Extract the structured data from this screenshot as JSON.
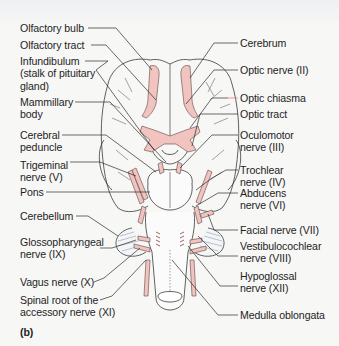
{
  "figure": {
    "panel_label": "(b)",
    "colors": {
      "nerve_pink": "#f2c4c0",
      "outline": "#3a3a3a",
      "leader": "#2b2b2b",
      "highlight_leader": "#e07070",
      "background": "#f7f7f6"
    },
    "left_labels": [
      {
        "id": "olfactory-bulb",
        "text": "Olfactory bulb"
      },
      {
        "id": "olfactory-tract",
        "text": "Olfactory tract"
      },
      {
        "id": "infundibulum",
        "text": "Infundibulum\n(stalk of pituitary\ngland)"
      },
      {
        "id": "mammillary-body",
        "text": "Mammillary\nbody"
      },
      {
        "id": "cerebral-peduncle",
        "text": "Cerebral\npeduncle"
      },
      {
        "id": "trigeminal-nerve",
        "text": "Trigeminal\nnerve (V)"
      },
      {
        "id": "pons",
        "text": "Pons"
      },
      {
        "id": "cerebellum",
        "text": "Cerebellum"
      },
      {
        "id": "glossopharyngeal-nerve",
        "text": "Glossopharyngeal\nnerve (IX)"
      },
      {
        "id": "vagus-nerve",
        "text": "Vagus nerve (X)"
      },
      {
        "id": "spinal-accessory",
        "text": "Spinal root of the\naccessory nerve (XI)"
      }
    ],
    "right_labels": [
      {
        "id": "cerebrum",
        "text": "Cerebrum"
      },
      {
        "id": "optic-nerve",
        "text": "Optic nerve (II)"
      },
      {
        "id": "optic-chiasma",
        "text": "Optic chiasma"
      },
      {
        "id": "optic-tract",
        "text": "Optic tract"
      },
      {
        "id": "oculomotor-nerve",
        "text": "Oculomotor\nnerve (III)"
      },
      {
        "id": "trochlear-nerve",
        "text": "Trochlear\nnerve (IV)"
      },
      {
        "id": "abducens-nerve",
        "text": "Abducens\nnerve (VI)"
      },
      {
        "id": "facial-nerve",
        "text": "Facial nerve (VII)"
      },
      {
        "id": "vestibulocochlear-nerve",
        "text": "Vestibulocochlear\nnerve (VIII)"
      },
      {
        "id": "hypoglossal-nerve",
        "text": "Hypoglossal\nnerve (XII)"
      },
      {
        "id": "medulla-oblongata",
        "text": "Medulla oblongata"
      }
    ]
  }
}
